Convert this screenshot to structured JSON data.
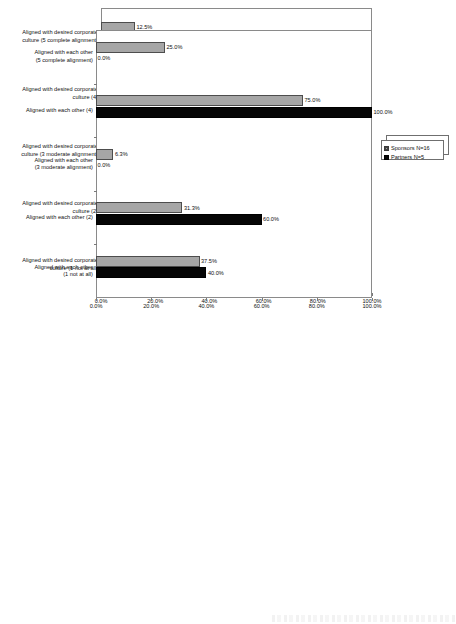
{
  "legend": {
    "entries": [
      {
        "label": "Sponsors N=16",
        "swatch": "sponsors-swatch-icon",
        "color": "#a6a6a6"
      },
      {
        "label": "Partners N=5",
        "swatch": "partners-swatch-icon",
        "color": "#060606"
      }
    ]
  },
  "axis": {
    "ticks": [
      "0.0%",
      "20.0%",
      "40.0%",
      "60.0%",
      "80.0%",
      "100.0%"
    ]
  },
  "chart_data": [
    {
      "type": "bar",
      "orientation": "horizontal",
      "title": "",
      "xlabel": "",
      "ylabel": "",
      "xlim": [
        0,
        100
      ],
      "grid": false,
      "legend_position": "right",
      "tick_labels": [
        "0.0%",
        "20.0%",
        "40.0%",
        "60.0%",
        "80.0%",
        "100.0%"
      ],
      "categories": [
        "Aligned with desired corporate\nculture (5 complete alignment)",
        "Aligned with desired corporate\nculture (4)",
        "Aligned with desired corporate\nculture (3 moderate alignment)",
        "Aligned with desired corporate\nculture (2)",
        "Aligned with desired corporate\nculture (1 not at all)"
      ],
      "series": [
        {
          "name": "Sponsors N=16",
          "values": [
            12.5,
            12.5,
            0.0,
            12.5,
            6.3
          ],
          "labels": [
            "12.5%",
            "12.5%",
            "0.0%",
            "12.5%",
            "6.3%"
          ]
        },
        {
          "name": "Partners N=5",
          "values": [
            0.0,
            0.0,
            20.0,
            60.0,
            0.0
          ],
          "labels": [
            "0.0%",
            "0.0%",
            "20.0%",
            "60.0%",
            "0.0%"
          ]
        }
      ]
    },
    {
      "type": "bar",
      "orientation": "horizontal",
      "title": "",
      "xlabel": "",
      "ylabel": "",
      "xlim": [
        0,
        100
      ],
      "grid": false,
      "legend_position": "right",
      "tick_labels": [
        "0.0%",
        "20.0%",
        "40.0%",
        "60.0%",
        "80.0%",
        "100.0%"
      ],
      "categories": [
        "Aligned with each other\n(5 complete alignment)",
        "Aligned with each other (4)",
        "Aligned with each other\n(3 moderate alignment)",
        "Aligned with each other (2)",
        "Aligned with each other\n(1 not at all)"
      ],
      "series": [
        {
          "name": "Sponsors N=16",
          "values": [
            25.0,
            75.0,
            6.3,
            31.3,
            37.5
          ],
          "labels": [
            "25.0%",
            "75.0%",
            "6.3%",
            "31.3%",
            "37.5%"
          ]
        },
        {
          "name": "Partners N=5",
          "values": [
            0.0,
            100.0,
            0.0,
            60.0,
            40.0
          ],
          "labels": [
            "0.0%",
            "100.0%",
            "0.0%",
            "60.0%",
            "40.0%"
          ]
        }
      ]
    }
  ]
}
